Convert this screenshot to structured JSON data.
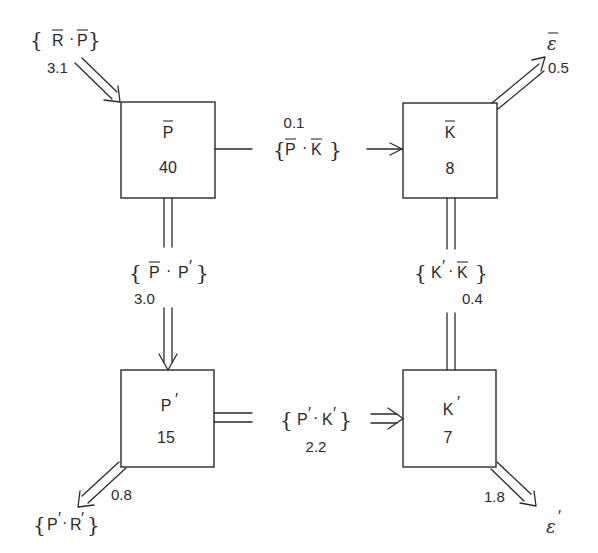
{
  "diagram": {
    "style": {
      "stroke_color": "#2a2a2a",
      "background": "#ffffff"
    },
    "nodes": {
      "p_bar": {
        "symbol": "P",
        "overbar": true,
        "prime": false,
        "value": "40"
      },
      "k_bar": {
        "symbol": "K",
        "overbar": true,
        "prime": false,
        "value": "8"
      },
      "p_prime": {
        "symbol": "P",
        "overbar": false,
        "prime": true,
        "value": "15"
      },
      "k_prime": {
        "symbol": "K",
        "overbar": false,
        "prime": true,
        "value": "7"
      }
    },
    "flows": {
      "r_bar_to_p_bar": {
        "from": "R̄",
        "to": "P̄",
        "label_a": "R",
        "label_b": "P",
        "value": "3.1",
        "arrow": "double"
      },
      "p_bar_to_k_bar": {
        "from": "P̄",
        "to": "K̄",
        "label_a": "P",
        "label_b": "K",
        "value": "0.1",
        "arrow": "single"
      },
      "k_bar_to_eps_bar": {
        "from": "K̄",
        "to": "ε̄",
        "target_symbol": "ε",
        "value": "0.5",
        "arrow": "double"
      },
      "p_bar_to_p_prime": {
        "from": "P̄",
        "to": "P′",
        "label_a": "P",
        "label_b": "P",
        "value": "3.0",
        "arrow": "double"
      },
      "k_prime_k_bar": {
        "from": "K′",
        "to": "K̄",
        "label_a": "K",
        "label_b": "K",
        "value": "0.4",
        "arrow": "none"
      },
      "p_prime_to_k_prime": {
        "from": "P′",
        "to": "K′",
        "label_a": "P",
        "label_b": "K",
        "value": "2.2",
        "arrow": "double"
      },
      "p_prime_to_r_prime": {
        "from": "P′",
        "to": "R′",
        "label_a": "P",
        "label_b": "R",
        "value": "0.8",
        "arrow": "double"
      },
      "k_prime_to_eps_prime": {
        "from": "K′",
        "to": "ε′",
        "target_symbol": "ε",
        "value": "1.8",
        "arrow": "double"
      }
    },
    "glyphs": {
      "brace_open": "{",
      "brace_close": "}",
      "dot": "·",
      "prime": "′"
    }
  }
}
